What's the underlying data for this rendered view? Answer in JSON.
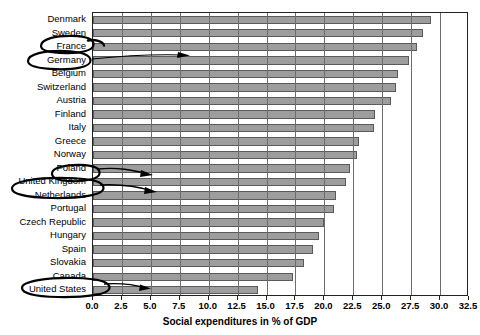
{
  "chart_data": {
    "type": "bar",
    "orientation": "horizontal",
    "title": "",
    "xlabel": "Social expenditures in % of GDP",
    "ylabel": "",
    "xlim": [
      0.0,
      32.5
    ],
    "xticks": [
      "0.0",
      "2.5",
      "5.0",
      "7.5",
      "10.0",
      "12.5",
      "15.0",
      "17.5",
      "20.0",
      "22.5",
      "25.0",
      "27.5",
      "30.0",
      "32.5"
    ],
    "xtick_values": [
      0.0,
      2.5,
      5.0,
      7.5,
      10.0,
      12.5,
      15.0,
      17.5,
      20.0,
      22.5,
      25.0,
      27.5,
      30.0,
      32.5
    ],
    "grid": true,
    "grid_axis": "x",
    "legend": "none",
    "bar_color": "#9d9d9d",
    "bar_edge_color": "#5a5a5a",
    "categories": [
      "Denmark",
      "Sweden",
      "France",
      "Germany",
      "Belgium",
      "Switzerland",
      "Austria",
      "Finland",
      "Italy",
      "Greece",
      "Norway",
      "Poland",
      "United Kingdom",
      "Netherlands",
      "Portugal",
      "Czech Republic",
      "Hungary",
      "Spain",
      "Slovakia",
      "Canada",
      "United States"
    ],
    "values": [
      29.2,
      28.5,
      28.0,
      27.3,
      26.4,
      26.2,
      25.8,
      24.4,
      24.3,
      23.0,
      22.8,
      22.2,
      21.9,
      21.0,
      20.8,
      20.0,
      19.5,
      19.0,
      18.2,
      17.3,
      14.3
    ]
  },
  "annotations": {
    "circled_categories": [
      "France",
      "Germany",
      "Poland",
      "United Kingdom",
      "United States"
    ],
    "style": "hand-drawn ellipse with pointer line",
    "color": "#000000"
  }
}
